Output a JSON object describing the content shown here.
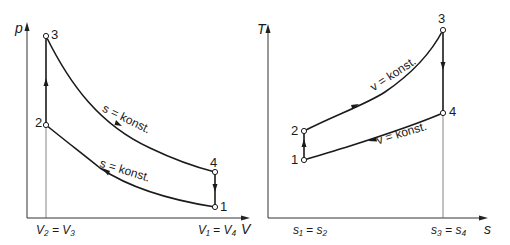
{
  "diagrams": {
    "pv": {
      "y_axis_label": "p",
      "x_axis_label": "V",
      "x_tick_left": "V₂ = V₃",
      "x_tick_right": "V₁ = V₄",
      "points": {
        "p1": "1",
        "p2": "2",
        "p3": "3",
        "p4": "4"
      },
      "curve_upper_label": "s = konst.",
      "curve_lower_label": "s = konst."
    },
    "ts": {
      "y_axis_label": "T",
      "x_axis_label": "s",
      "x_tick_left": "s₁ = s₂",
      "x_tick_right": "s₃ = s₄",
      "points": {
        "p1": "1",
        "p2": "2",
        "p3": "3",
        "p4": "4"
      },
      "curve_upper_label": "v = konst.",
      "curve_lower_label": "v = konst."
    }
  },
  "colors": {
    "line": "#1a1a1a",
    "thin_line": "#555555",
    "background": "#ffffff"
  }
}
